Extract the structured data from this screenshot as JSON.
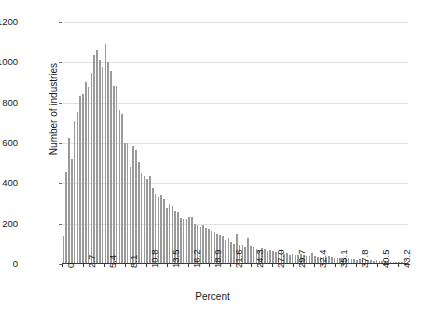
{
  "chart_data": {
    "type": "bar",
    "title": "",
    "subtitle": "",
    "xlabel": "Percent",
    "ylabel": "Number of industries",
    "xlim": [
      0,
      44.55
    ],
    "ylim": [
      0,
      1200
    ],
    "grid": true,
    "legend": null,
    "bar_color": "#9a9a9a",
    "grid_color": "#e2e2e2",
    "axis_color": "#3a3a3a",
    "bin_width": 0.36,
    "x_tick_labels": [
      "0",
      "2.7",
      "5.4",
      "8.1",
      "10.8",
      "13.5",
      "16.2",
      "18.9",
      "21.6",
      "24.3",
      "27.0",
      "29.7",
      "32.4",
      "35.1",
      "37.8",
      "40.5",
      "43.2"
    ],
    "x_tick_values": [
      0,
      2.7,
      5.4,
      8.1,
      10.8,
      13.5,
      16.2,
      18.9,
      21.6,
      24.3,
      27.0,
      29.7,
      32.4,
      35.1,
      37.8,
      40.5,
      43.2
    ],
    "y_tick_labels": [
      "0",
      "200",
      "400",
      "600",
      "800",
      "1000",
      "1200"
    ],
    "y_tick_values": [
      0,
      200,
      400,
      600,
      800,
      1000,
      1200
    ],
    "x": [
      0.18,
      0.54,
      0.9,
      1.26,
      1.62,
      1.98,
      2.34,
      2.7,
      3.06,
      3.42,
      3.78,
      4.14,
      4.5,
      4.86,
      5.22,
      5.58,
      5.94,
      6.3,
      6.66,
      7.02,
      7.38,
      7.74,
      8.1,
      8.46,
      8.82,
      9.18,
      9.54,
      9.9,
      10.26,
      10.62,
      10.98,
      11.34,
      11.7,
      12.06,
      12.42,
      12.78,
      13.14,
      13.5,
      13.86,
      14.22,
      14.58,
      14.94,
      15.3,
      15.66,
      16.02,
      16.38,
      16.74,
      17.1,
      17.46,
      17.82,
      18.18,
      18.54,
      18.9,
      19.26,
      19.62,
      19.98,
      20.34,
      20.7,
      21.06,
      21.42,
      21.78,
      22.14,
      22.5,
      22.86,
      23.22,
      23.58,
      23.94,
      24.3,
      24.66,
      25.02,
      25.38,
      25.74,
      26.1,
      26.46,
      26.82,
      27.18,
      27.54,
      27.9,
      28.26,
      28.62,
      28.98,
      29.34,
      29.7,
      30.06,
      30.42,
      30.78,
      31.14,
      31.5,
      31.86,
      32.22,
      32.58,
      32.94,
      33.3,
      33.66,
      34.02,
      34.38,
      34.74,
      35.1,
      35.46,
      35.82,
      36.18,
      36.54,
      36.9,
      37.26,
      37.62,
      37.98,
      38.34,
      38.7,
      39.06,
      39.42,
      39.78,
      40.14,
      40.5,
      40.86,
      41.22,
      41.58,
      41.94,
      42.3,
      42.66,
      43.02,
      43.38,
      43.74,
      44.1,
      44.46
    ],
    "values": [
      140,
      455,
      625,
      520,
      710,
      755,
      835,
      845,
      905,
      880,
      945,
      1035,
      1060,
      1010,
      975,
      1090,
      1000,
      955,
      885,
      885,
      765,
      745,
      600,
      600,
      480,
      585,
      565,
      505,
      450,
      435,
      420,
      435,
      375,
      345,
      330,
      340,
      320,
      280,
      300,
      290,
      265,
      260,
      230,
      225,
      225,
      235,
      235,
      200,
      195,
      185,
      195,
      180,
      175,
      165,
      160,
      150,
      145,
      140,
      120,
      130,
      110,
      100,
      150,
      95,
      95,
      85,
      130,
      90,
      85,
      75,
      70,
      80,
      75,
      65,
      70,
      65,
      60,
      55,
      70,
      50,
      55,
      45,
      50,
      45,
      45,
      50,
      45,
      40,
      40,
      55,
      40,
      35,
      35,
      35,
      35,
      40,
      35,
      30,
      30,
      30,
      30,
      25,
      30,
      25,
      25,
      20,
      25,
      20,
      20,
      20,
      20,
      15,
      20,
      15,
      15,
      15,
      12,
      12,
      10,
      10,
      10,
      8,
      8,
      8
    ]
  }
}
